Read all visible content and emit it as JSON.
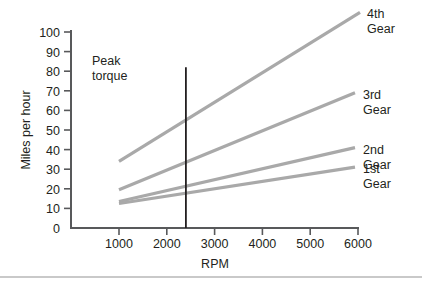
{
  "chart_data": {
    "type": "line",
    "title": "",
    "xlabel": "RPM",
    "ylabel": "Miles per hour",
    "xlim": [
      500,
      6300
    ],
    "ylim": [
      0,
      100
    ],
    "grid": false,
    "legend_position": "right-inline",
    "x_ticks": [
      "1000",
      "2000",
      "3000",
      "4000",
      "5000",
      "6000"
    ],
    "x_tick_values": [
      1000,
      2000,
      3000,
      4000,
      5000,
      6000
    ],
    "y_ticks": [
      "0",
      "10",
      "20",
      "30",
      "40",
      "50",
      "60",
      "70",
      "80",
      "90",
      "100"
    ],
    "y_tick_values": [
      0,
      10,
      20,
      30,
      40,
      50,
      60,
      70,
      80,
      90,
      100
    ],
    "series": [
      {
        "name": "4th Gear",
        "label_line1": "4th",
        "label_line2": "Gear",
        "color": "#a9a9a9",
        "x": [
          1000,
          6000
        ],
        "values": [
          34,
          110
        ]
      },
      {
        "name": "3rd Gear",
        "label_line1": "3rd",
        "label_line2": "Gear",
        "color": "#a9a9a9",
        "x": [
          1000,
          6000
        ],
        "values": [
          19.5,
          69
        ]
      },
      {
        "name": "2nd Gear",
        "label_line1": "2nd",
        "label_line2": "Gear",
        "color": "#a9a9a9",
        "x": [
          1000,
          6000
        ],
        "values": [
          13.5,
          41
        ]
      },
      {
        "name": "1st Gear",
        "label_line1": "1st",
        "label_line2": "Gear",
        "color": "#a9a9a9",
        "x": [
          1000,
          6000
        ],
        "values": [
          12.5,
          31
        ]
      }
    ],
    "annotations": [
      {
        "name": "peak-torque",
        "label_line1": "Peak",
        "label_line2": "torque",
        "type": "vertical-line",
        "x_value": 2400,
        "y_from": 0,
        "y_to": 82,
        "color": "#231f20"
      }
    ]
  },
  "axes": {
    "x_title": "RPM",
    "y_title": "Miles per hour"
  },
  "colors": {
    "series": "#a9a9a9",
    "axis": "#58595b",
    "annotation": "#231f20",
    "text": "#231f20",
    "footer_rule": "#b7b7b7"
  }
}
